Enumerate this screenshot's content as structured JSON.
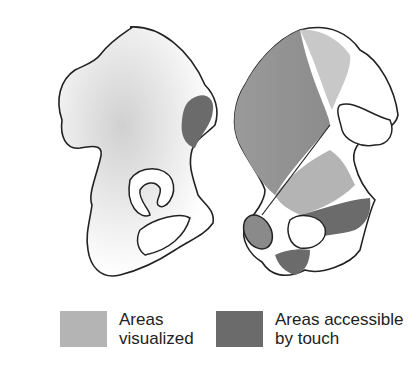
{
  "figure": {
    "left_view": "bone-outer-view",
    "right_view": "bone-inner-view"
  },
  "legend": {
    "items": [
      {
        "label_line1": "Areas",
        "label_line2": "visualized",
        "color": "#b4b4b4"
      },
      {
        "label_line1": "Areas accessible",
        "label_line2": "by touch",
        "color": "#6b6b6b"
      }
    ]
  },
  "colors": {
    "visualized": "#b4b4b4",
    "touch": "#6b6b6b",
    "outline": "#222222",
    "bone": "#ffffff"
  }
}
